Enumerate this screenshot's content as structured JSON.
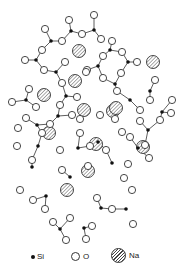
{
  "diagram": {
    "legend": [
      {
        "symbol": "si-dot",
        "label": "Si"
      },
      {
        "symbol": "o-circle",
        "label": "O"
      },
      {
        "symbol": "na-hatched-circle",
        "label": "Na"
      }
    ],
    "colors": {
      "si": "#111111",
      "o_stroke": "#333333",
      "na_hatch": "#444444",
      "bond": "#333333"
    }
  }
}
